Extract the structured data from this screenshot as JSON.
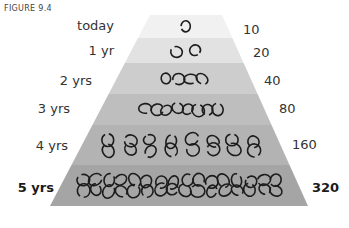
{
  "figure_label": "FIGURE 9.4",
  "levels": [
    {
      "time": "today",
      "count": "10",
      "rings": 1,
      "color": "#f1f1f1"
    },
    {
      "time": "1 yr",
      "count": "20",
      "rings": 2,
      "color": "#e2e2e2"
    },
    {
      "time": "2 yrs",
      "count": "40",
      "rings": 4,
      "color": "#cdcdcd"
    },
    {
      "time": "3 yrs",
      "count": "80",
      "rings": 8,
      "color": "#bebebe"
    },
    {
      "time": "4 yrs",
      "count": "160",
      "rings": 16,
      "color": "#b3b3b3"
    },
    {
      "time": "5 yrs",
      "count": "320",
      "rings": 32,
      "color": "#a5a5a5"
    }
  ],
  "chart_data": {
    "type": "pyramid",
    "title": "FIGURE 9.4",
    "categories": [
      "today",
      "1 yr",
      "2 yrs",
      "3 yrs",
      "4 yrs",
      "5 yrs"
    ],
    "values": [
      10,
      20,
      40,
      80,
      160,
      320
    ],
    "rings_drawn": [
      1,
      2,
      4,
      8,
      16,
      32
    ],
    "note": "Quantity doubles each year; rings illustrate growth"
  }
}
